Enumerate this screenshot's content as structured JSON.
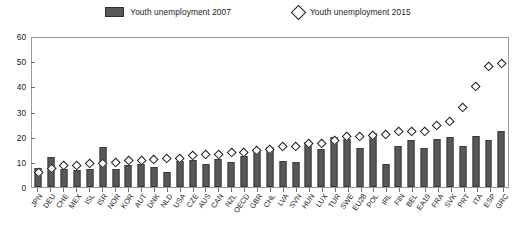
{
  "legend": {
    "items": [
      {
        "label": "Youth unemployment 2007",
        "marker": "filled-bar-swatch",
        "color": "#58585a"
      },
      {
        "label": "Youth unemployment 2015",
        "marker": "open-diamond-swatch",
        "color": "#ffffff"
      }
    ]
  },
  "axes": {
    "y_ticks": [
      "0",
      "10",
      "20",
      "30",
      "40",
      "50",
      "60"
    ],
    "y_min": 0,
    "y_max": 60
  },
  "chart_data": {
    "type": "bar",
    "title": "",
    "subtitle": "",
    "xlabel": "",
    "ylabel": "",
    "ylim": [
      0,
      60
    ],
    "ytick_step": 10,
    "grid": false,
    "legend_position": "top-center",
    "categories": [
      "JPN",
      "DEU",
      "CHE",
      "MEX",
      "ISL",
      "ISR",
      "NOR",
      "KOR",
      "AUT",
      "DNK",
      "NLD",
      "USA",
      "CZE",
      "AUS",
      "CAN",
      "NZL",
      "OECD",
      "GBR",
      "CHL",
      "LVA",
      "SVN",
      "HUN",
      "LUX",
      "TUR",
      "SWE",
      "EU28",
      "POL",
      "IRL",
      "FIN",
      "BEL",
      "EA19",
      "FRA",
      "SVK",
      "PRT",
      "ITA",
      "ESP",
      "GRC"
    ],
    "series": [
      {
        "name": "Youth unemployment 2007",
        "marker": "bar",
        "color": "#58585a",
        "values": [
          7.7,
          11.9,
          7.1,
          7.0,
          7.2,
          16.0,
          7.3,
          8.8,
          9.4,
          7.9,
          5.9,
          10.5,
          10.7,
          9.4,
          11.2,
          10.0,
          12.5,
          14.3,
          16.0,
          10.6,
          10.1,
          18.1,
          15.2,
          20.0,
          19.2,
          15.7,
          21.6,
          9.1,
          16.4,
          18.8,
          15.7,
          19.5,
          20.1,
          16.6,
          20.4,
          18.8,
          22.7
        ]
      },
      {
        "name": "Youth unemployment 2015",
        "marker": "open-diamond",
        "color": "#ffffff",
        "values": [
          5.6,
          7.2,
          8.6,
          8.6,
          9.2,
          9.2,
          9.9,
          10.5,
          10.6,
          10.8,
          11.3,
          11.6,
          12.6,
          13.1,
          13.2,
          13.8,
          13.9,
          14.6,
          15.0,
          16.3,
          16.3,
          17.3,
          17.3,
          18.5,
          20.4,
          20.3,
          20.8,
          20.9,
          22.4,
          22.1,
          22.2,
          24.7,
          26.5,
          32.0,
          40.3,
          48.3,
          49.8
        ]
      }
    ]
  }
}
